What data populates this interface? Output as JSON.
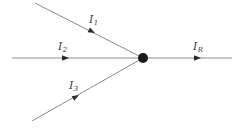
{
  "diagram": {
    "type": "circuit-node",
    "colors": {
      "background": "#ffffff",
      "line": "#8a8a8a",
      "arrow": "#2b2b2b",
      "node": "#1a1a1a",
      "label": "#3a3a3a"
    },
    "node": {
      "name": "junction-node",
      "x": 143,
      "y": 58,
      "radius": 5
    },
    "branches": [
      {
        "id": "i1",
        "label_base": "I",
        "label_sub": "1",
        "direction": "incoming",
        "from_x": 35,
        "from_y": 3,
        "to_x": 143,
        "to_y": 58,
        "arrow_x": 95,
        "arrow_y": 33,
        "label_x": 89,
        "label_y": 14
      },
      {
        "id": "i2",
        "label_base": "I",
        "label_sub": "2",
        "direction": "incoming",
        "from_x": 12,
        "from_y": 58,
        "to_x": 143,
        "to_y": 58,
        "arrow_x": 68,
        "arrow_y": 58,
        "label_x": 58,
        "label_y": 41
      },
      {
        "id": "i3",
        "label_base": "I",
        "label_sub": "3",
        "direction": "incoming",
        "from_x": 32,
        "from_y": 121,
        "to_x": 143,
        "to_y": 58,
        "arrow_x": 79,
        "arrow_y": 95,
        "label_x": 69,
        "label_y": 80
      },
      {
        "id": "ir",
        "label_base": "I",
        "label_sub": "R",
        "direction": "outgoing",
        "from_x": 143,
        "from_y": 58,
        "to_x": 232,
        "to_y": 58,
        "arrow_x": 200,
        "arrow_y": 58,
        "label_x": 193,
        "label_y": 41
      }
    ]
  }
}
